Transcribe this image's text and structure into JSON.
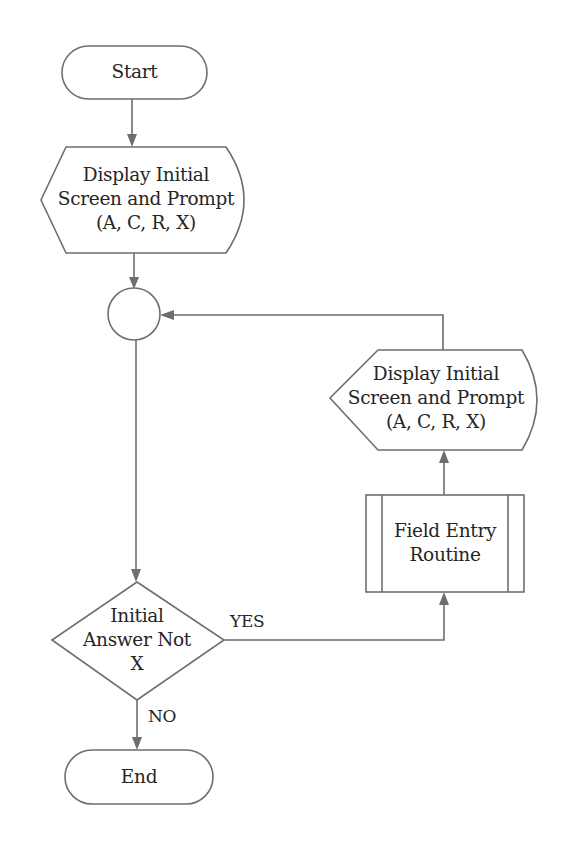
{
  "diagram": {
    "type": "flowchart",
    "colors": {
      "stroke": "#6e6e6e",
      "text": "#262626",
      "background": "#ffffff"
    },
    "nodes": {
      "start": {
        "shape": "terminal",
        "label": "Start"
      },
      "display1": {
        "shape": "display",
        "lines": [
          "Display Initial",
          "Screen and Prompt",
          "(A, C, R, X)"
        ]
      },
      "connector": {
        "shape": "connector",
        "label": ""
      },
      "decision": {
        "shape": "decision",
        "lines": [
          "Initial",
          "Answer Not",
          "X"
        ]
      },
      "field_entry": {
        "shape": "predefined-process",
        "lines": [
          "Field Entry",
          "Routine"
        ]
      },
      "display2": {
        "shape": "display",
        "lines": [
          "Display Initial",
          "Screen and Prompt",
          "(A, C, R, X)"
        ]
      },
      "end": {
        "shape": "terminal",
        "label": "End"
      }
    },
    "edges": {
      "yes_label": "YES",
      "no_label": "NO"
    }
  }
}
